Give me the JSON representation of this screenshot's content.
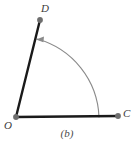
{
  "figure": {
    "caption": "(b)",
    "width": 134,
    "height": 146,
    "background_color": "#ffffff"
  },
  "colors": {
    "segment_stroke": "#1a1a1a",
    "arc_stroke": "#8a8a8a",
    "vertex_fill": "#6e6e6e",
    "label_text": "#3a3a3a",
    "caption_text": "#4a4a4a"
  },
  "points": [
    {
      "id": "D",
      "label": "D",
      "x": 40,
      "y": 20
    },
    {
      "id": "O",
      "label": "O",
      "x": 16,
      "y": 117
    },
    {
      "id": "C",
      "label": "C",
      "x": 118,
      "y": 116
    }
  ],
  "segments": [
    {
      "id": "OD",
      "from": "O",
      "to": "D",
      "stroke": "#1a1a1a",
      "width": 2.4
    },
    {
      "id": "OC",
      "from": "O",
      "to": "C",
      "stroke": "#1a1a1a",
      "width": 2.4
    }
  ],
  "arc": {
    "id": "angle-sweep-arc",
    "center_x": 16,
    "center_y": 117,
    "radius": 84,
    "start_x": 37,
    "start_y": 39,
    "end_x": 99,
    "end_y": 117,
    "stroke": "#8a8a8a",
    "width": 1.1,
    "direction": "from-OC-to-OD",
    "arrowhead": {
      "id": "arc-arrowhead",
      "tip_x": 36,
      "tip_y": 39,
      "points": "36,39.4 44,36.6 43.4,42.2",
      "fill": "#8a8a8a"
    }
  },
  "chart_data": {
    "type": "diagram",
    "title": "(b)",
    "vertices": {
      "O": [
        16,
        117
      ],
      "C": [
        118,
        116
      ],
      "D": [
        40,
        20
      ]
    },
    "labels": [
      "D",
      "O",
      "C",
      "(b)"
    ]
  }
}
